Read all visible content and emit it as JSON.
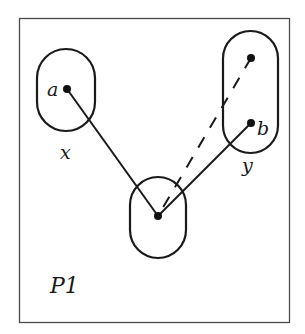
{
  "diagram": {
    "panel_label": "P1",
    "colors": {
      "stroke": "#1a1a1a",
      "frame": "#4a4a4a",
      "background": "#ffffff"
    },
    "regions": [
      {
        "id": "region-x",
        "label": "x"
      },
      {
        "id": "region-y",
        "label": "y"
      },
      {
        "id": "region-center",
        "label": ""
      }
    ],
    "points": [
      {
        "id": "a",
        "label": "a",
        "region": "x"
      },
      {
        "id": "y-top",
        "label": "",
        "region": "y"
      },
      {
        "id": "b",
        "label": "b",
        "region": "y"
      },
      {
        "id": "center",
        "label": "",
        "region": "center"
      }
    ],
    "edges": [
      {
        "from": "a",
        "to": "center",
        "style": "solid"
      },
      {
        "from": "b",
        "to": "center",
        "style": "solid"
      },
      {
        "from": "y-top",
        "to": "center",
        "style": "dashed"
      }
    ]
  }
}
